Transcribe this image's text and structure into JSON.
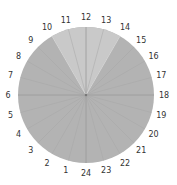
{
  "diagram": {
    "type": "sector-wheel",
    "sector_count": 24,
    "center": {
      "x": 86,
      "y": 95
    },
    "radius": 68,
    "label_radius": 78,
    "labels": [
      "1",
      "2",
      "3",
      "4",
      "5",
      "6",
      "7",
      "8",
      "9",
      "10",
      "11",
      "12",
      "13",
      "14",
      "15",
      "16",
      "17",
      "18",
      "19",
      "20",
      "21",
      "22",
      "23",
      "24"
    ],
    "highlight": {
      "from_label": "10",
      "to_label": "14"
    },
    "colors": {
      "base_fill": "#b3b3b3",
      "highlight_fill": "#c9c9c9",
      "spoke": "#a6a6a6",
      "label_text": "#333333",
      "center_dot": "#777777",
      "highlight_edge": "#e2e2e2"
    }
  }
}
